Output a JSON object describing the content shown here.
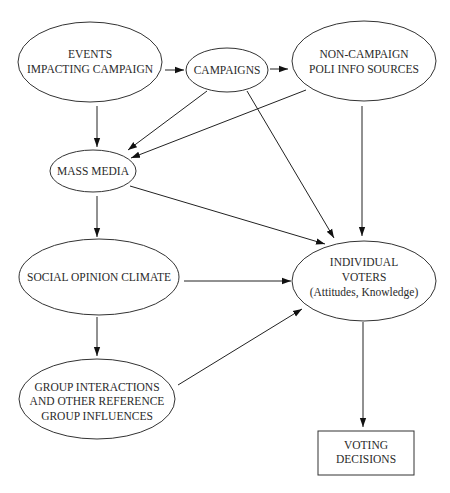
{
  "diagram": {
    "type": "flowchart",
    "nodes": {
      "events": {
        "lines": [
          "EVENTS",
          "IMPACTING CAMPAIGN"
        ],
        "shape": "ellipse"
      },
      "campaigns": {
        "lines": [
          "CAMPAIGNS"
        ],
        "shape": "ellipse"
      },
      "noncampaign": {
        "lines": [
          "NON-CAMPAIGN",
          "POLI INFO SOURCES"
        ],
        "shape": "ellipse"
      },
      "massmedia": {
        "lines": [
          "MASS MEDIA"
        ],
        "shape": "ellipse"
      },
      "social": {
        "lines": [
          "SOCIAL OPINION CLIMATE"
        ],
        "shape": "ellipse"
      },
      "voters": {
        "lines": [
          "INDIVIDUAL",
          "VOTERS",
          "(Attitudes, Knowledge)"
        ],
        "shape": "ellipse"
      },
      "group": {
        "lines": [
          "GROUP INTERACTIONS",
          "AND OTHER REFERENCE",
          "GROUP INFLUENCES"
        ],
        "shape": "ellipse"
      },
      "decisions": {
        "lines": [
          "VOTING",
          "DECISIONS"
        ],
        "shape": "rectangle"
      }
    },
    "edges": [
      {
        "from": "events",
        "to": "campaigns"
      },
      {
        "from": "campaigns",
        "to": "noncampaign"
      },
      {
        "from": "events",
        "to": "massmedia"
      },
      {
        "from": "campaigns",
        "to": "massmedia"
      },
      {
        "from": "noncampaign",
        "to": "massmedia"
      },
      {
        "from": "campaigns",
        "to": "voters"
      },
      {
        "from": "noncampaign",
        "to": "voters"
      },
      {
        "from": "massmedia",
        "to": "voters"
      },
      {
        "from": "massmedia",
        "to": "social"
      },
      {
        "from": "social",
        "to": "voters"
      },
      {
        "from": "social",
        "to": "group"
      },
      {
        "from": "group",
        "to": "voters"
      },
      {
        "from": "voters",
        "to": "decisions"
      }
    ],
    "colors": {
      "stroke": "#333333",
      "text": "#2a2a2a",
      "background": "#ffffff"
    }
  }
}
